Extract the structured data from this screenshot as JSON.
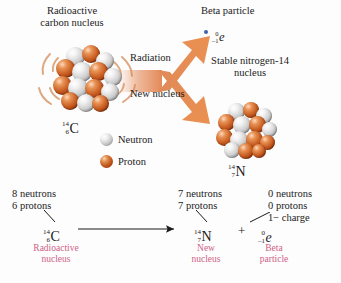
{
  "figure": {
    "background_color": "#fdfdfd",
    "arrow_color": "#e2834f",
    "label_color": "#cf5f86",
    "proton_color": "#c4561c",
    "neutron_color": "#cfcfcf",
    "beta_dot_color": "#3a63a8"
  },
  "callouts": {
    "parent_line1": "Radioactive",
    "parent_line2": "carbon nucleus",
    "radiation": "Radiation",
    "new_nucleus": "New nucleus",
    "beta_particle": "Beta particle",
    "stable_line1": "Stable nitrogen-14",
    "stable_line2": "nucleus"
  },
  "nuclides": {
    "carbon": {
      "mass": "14",
      "atomic": "6",
      "symbol": "C"
    },
    "nitrogen": {
      "mass": "14",
      "atomic": "7",
      "symbol": "N"
    },
    "electron": {
      "mass": "0",
      "atomic": "–1",
      "symbol": "e"
    }
  },
  "legend": {
    "items": [
      {
        "label": "Neutron",
        "kind": "neutron"
      },
      {
        "label": "Proton",
        "kind": "proton"
      }
    ]
  },
  "equation": {
    "reactant": {
      "counts": [
        "8 neutrons",
        "6 protons"
      ],
      "nuclide": {
        "mass": "14",
        "atomic": "6",
        "symbol": "C"
      },
      "caption_line1": "Radioactive",
      "caption_line2": "nucleus"
    },
    "operator_arrow": "→",
    "product1": {
      "counts": [
        "7 neutrons",
        "7 protons"
      ],
      "nuclide": {
        "mass": "14",
        "atomic": "7",
        "symbol": "N"
      },
      "caption_line1": "New",
      "caption_line2": "nucleus"
    },
    "plus": "+",
    "product2": {
      "counts": [
        "0 neutrons",
        "0 protons",
        "1− charge"
      ],
      "nuclide": {
        "mass": "0",
        "atomic": "–1",
        "symbol": "e"
      },
      "caption_line1": "Beta",
      "caption_line2": "particle"
    }
  }
}
